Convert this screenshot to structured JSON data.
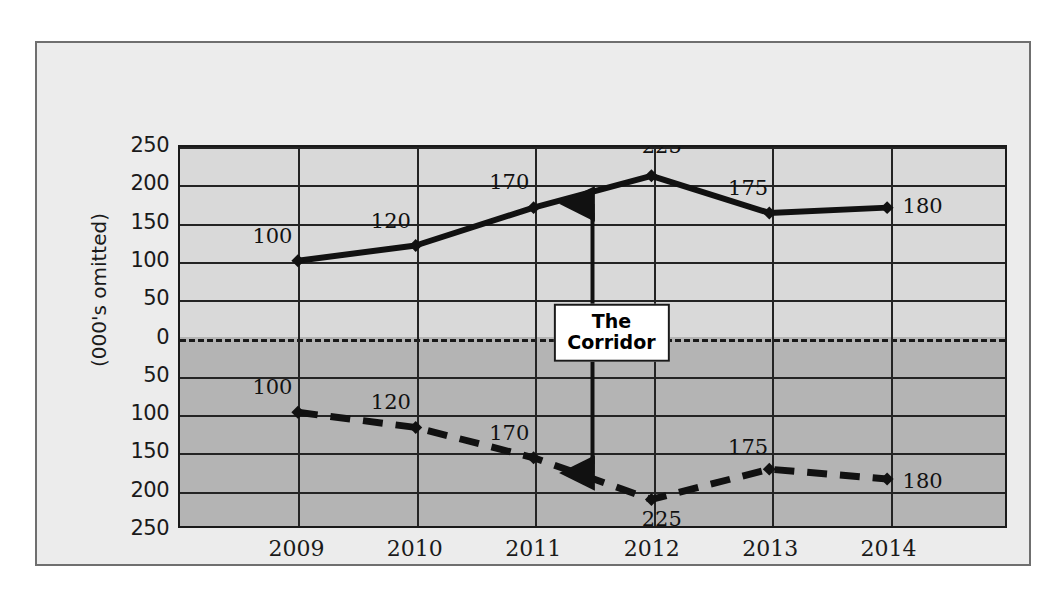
{
  "chart_data": {
    "type": "line",
    "title": "",
    "subtitle": "",
    "xlabel": "",
    "ylabel": "(000's omitted)",
    "categories": [
      "2009",
      "2010",
      "2011",
      "2012",
      "2013",
      "2014"
    ],
    "x_tick_labels": [
      "2009",
      "2010",
      "2011",
      "2012",
      "2013",
      "2014"
    ],
    "y_tick_labels": [
      "250",
      "200",
      "150",
      "100",
      "50",
      "0",
      "50",
      "100",
      "150",
      "200",
      "250"
    ],
    "y_tick_positions": [
      250,
      200,
      150,
      100,
      50,
      0,
      -50,
      -100,
      -150,
      -200,
      -250
    ],
    "ylim": [
      -250,
      250
    ],
    "grid": true,
    "legend": "none",
    "series": [
      {
        "name": "upper-boundary",
        "style": "solid",
        "color": "#111111",
        "values": [
          100,
          120,
          170,
          212,
          163,
          170
        ],
        "data_labels": [
          "100",
          "120",
          "170",
          "225",
          "175",
          "180"
        ]
      },
      {
        "name": "lower-boundary",
        "style": "dashed",
        "color": "#111111",
        "values": [
          -100,
          -120,
          -160,
          -215,
          -175,
          -188
        ],
        "data_labels": [
          "100",
          "120",
          "170",
          "225",
          "175",
          "180"
        ]
      }
    ],
    "annotations": [
      {
        "name": "corridor",
        "line1": "The",
        "line2": "Corridor",
        "arrow": "double-headed-vertical",
        "at_x": "between 2011 and 2012"
      }
    ],
    "colors": {
      "upper_band": "#d9d9d9",
      "lower_band": "#b4b4b4",
      "frame_background": "#ececec",
      "line": "#111111",
      "grid": "#242424"
    }
  }
}
